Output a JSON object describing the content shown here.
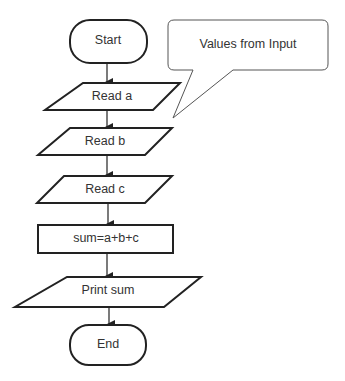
{
  "diagram": {
    "type": "flowchart",
    "nodes": [
      {
        "id": "start",
        "shape": "terminator",
        "label": "Start"
      },
      {
        "id": "read_a",
        "shape": "input-output",
        "label": "Read a"
      },
      {
        "id": "read_b",
        "shape": "input-output",
        "label": "Read b"
      },
      {
        "id": "read_c",
        "shape": "input-output",
        "label": "Read c"
      },
      {
        "id": "sum",
        "shape": "process",
        "label": "sum=a+b+c"
      },
      {
        "id": "print_sum",
        "shape": "input-output",
        "label": "Print sum"
      },
      {
        "id": "end",
        "shape": "terminator",
        "label": "End"
      }
    ],
    "edges": [
      {
        "from": "start",
        "to": "read_a"
      },
      {
        "from": "read_a",
        "to": "read_b"
      },
      {
        "from": "read_b",
        "to": "read_c"
      },
      {
        "from": "read_c",
        "to": "sum"
      },
      {
        "from": "sum",
        "to": "print_sum"
      },
      {
        "from": "print_sum",
        "to": "end"
      }
    ],
    "callout": {
      "label": "Values from Input",
      "points_to": "read_a"
    }
  }
}
